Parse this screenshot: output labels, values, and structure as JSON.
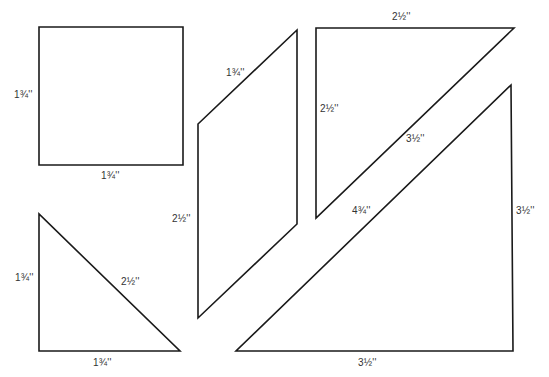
{
  "diagram": {
    "title": "",
    "stroke_color": "#1a1a1a",
    "label_color": "#333333",
    "shapes": [
      {
        "name": "square",
        "points": "39,27 183,27 183,165 39,165",
        "labels": {
          "side": "1¾''",
          "bottom": "1¾''"
        }
      },
      {
        "name": "small-right-triangle",
        "points": "39,214 39,351 180,351",
        "labels": {
          "side": "1¾''",
          "hypotenuse": "2½''",
          "bottom": "1¾''"
        }
      },
      {
        "name": "parallelogram",
        "points": "297,30 198,124 198,318 297,224",
        "labels": {
          "slant": "1¾''",
          "side": "2½''"
        }
      },
      {
        "name": "medium-right-triangle",
        "points": "316,28 514,28 316,218",
        "labels": {
          "top": "2½''",
          "side": "2½''",
          "hypotenuse": "3½''"
        }
      },
      {
        "name": "large-right-triangle",
        "points": "511,85 513,351 236,351",
        "labels": {
          "hypotenuse": "4¾''",
          "side": "3½''",
          "bottom": "3½''"
        }
      }
    ]
  }
}
